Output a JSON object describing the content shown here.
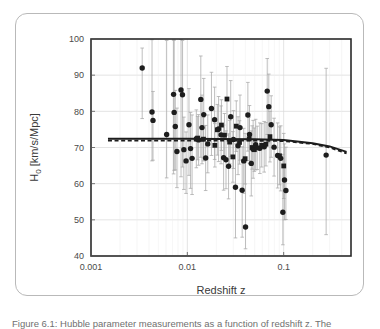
{
  "figure": {
    "caption": "Figure 6.1: Hubble parameter measurements as a function of redshift z. The"
  },
  "chart_data": {
    "type": "scatter",
    "title": "",
    "xlabel": "Redshift z",
    "ylabel": "H₀ [km/s/Mpc]",
    "xscale": "log",
    "yscale": "linear",
    "xlim": [
      0.001,
      0.5
    ],
    "ylim": [
      40,
      100
    ],
    "xticks": [
      0.001,
      0.01,
      0.1
    ],
    "xticklabels": [
      "0.001",
      "0.01",
      "0.1"
    ],
    "yticks": [
      40,
      50,
      60,
      70,
      80,
      90,
      100
    ],
    "yticklabels": [
      "40",
      "50",
      "60",
      "70",
      "80",
      "90",
      "100"
    ],
    "grid": true,
    "legend": "none",
    "series": [
      {
        "name": "H0 measurements (circles)",
        "marker": "circle",
        "color": "#1d1d1d",
        "points": [
          {
            "x": 0.0034,
            "y": 92.0,
            "yerr_lo": 14.0,
            "yerr_hi": 5.5
          },
          {
            "x": 0.0043,
            "y": 79.8,
            "yerr_lo": 13.5,
            "yerr_hi": 20.0
          },
          {
            "x": 0.0044,
            "y": 77.5,
            "yerr_lo": 11.0,
            "yerr_hi": 8.0
          },
          {
            "x": 0.0061,
            "y": 73.6,
            "yerr_lo": 12.0,
            "yerr_hi": 26.0
          },
          {
            "x": 0.0072,
            "y": 84.7,
            "yerr_lo": 22.0,
            "yerr_hi": 15.0
          },
          {
            "x": 0.0073,
            "y": 79.7,
            "yerr_lo": 16.0,
            "yerr_hi": 20.0
          },
          {
            "x": 0.0075,
            "y": 75.8,
            "yerr_lo": 12.0,
            "yerr_hi": 10.0
          },
          {
            "x": 0.0078,
            "y": 68.9,
            "yerr_lo": 10.0,
            "yerr_hi": 12.0
          },
          {
            "x": 0.0086,
            "y": 85.9,
            "yerr_lo": 24.0,
            "yerr_hi": 14.0
          },
          {
            "x": 0.0089,
            "y": 84.6,
            "yerr_lo": 20.0,
            "yerr_hi": 15.0
          },
          {
            "x": 0.0092,
            "y": 69.4,
            "yerr_lo": 11.0,
            "yerr_hi": 9.0
          },
          {
            "x": 0.0097,
            "y": 66.3,
            "yerr_lo": 9.0,
            "yerr_hi": 8.0
          },
          {
            "x": 0.0104,
            "y": 76.3,
            "yerr_lo": 14.0,
            "yerr_hi": 10.0
          },
          {
            "x": 0.0108,
            "y": 69.7,
            "yerr_lo": 11.0,
            "yerr_hi": 10.0
          },
          {
            "x": 0.0112,
            "y": 67.0,
            "yerr_lo": 10.0,
            "yerr_hi": 12.0
          },
          {
            "x": 0.0124,
            "y": 72.4,
            "yerr_lo": 8.0,
            "yerr_hi": 8.0
          },
          {
            "x": 0.0131,
            "y": 72.1,
            "yerr_lo": 7.0,
            "yerr_hi": 7.0
          },
          {
            "x": 0.0138,
            "y": 83.3,
            "yerr_lo": 16.0,
            "yerr_hi": 12.0
          },
          {
            "x": 0.0142,
            "y": 75.5,
            "yerr_lo": 10.0,
            "yerr_hi": 9.0
          },
          {
            "x": 0.0148,
            "y": 79.1,
            "yerr_lo": 12.0,
            "yerr_hi": 10.0
          },
          {
            "x": 0.0155,
            "y": 67.1,
            "yerr_lo": 9.0,
            "yerr_hi": 9.0
          },
          {
            "x": 0.0163,
            "y": 71.0,
            "yerr_lo": 8.0,
            "yerr_hi": 8.0
          },
          {
            "x": 0.0178,
            "y": 80.8,
            "yerr_lo": 13.0,
            "yerr_hi": 10.0
          },
          {
            "x": 0.0192,
            "y": 77.7,
            "yerr_lo": 11.0,
            "yerr_hi": 9.0
          },
          {
            "x": 0.0211,
            "y": 75.1,
            "yerr_lo": 9.0,
            "yerr_hi": 9.0
          },
          {
            "x": 0.0224,
            "y": 73.5,
            "yerr_lo": 8.0,
            "yerr_hi": 8.0
          },
          {
            "x": 0.0238,
            "y": 67.2,
            "yerr_lo": 9.0,
            "yerr_hi": 9.0
          },
          {
            "x": 0.0252,
            "y": 66.6,
            "yerr_lo": 8.0,
            "yerr_hi": 8.0
          },
          {
            "x": 0.0268,
            "y": 64.8,
            "yerr_lo": 9.0,
            "yerr_hi": 9.0
          },
          {
            "x": 0.0282,
            "y": 78.5,
            "yerr_lo": 11.0,
            "yerr_hi": 10.0
          },
          {
            "x": 0.0301,
            "y": 72.2,
            "yerr_lo": 8.0,
            "yerr_hi": 8.0
          },
          {
            "x": 0.0316,
            "y": 59.0,
            "yerr_lo": 14.0,
            "yerr_hi": 12.0
          },
          {
            "x": 0.0336,
            "y": 70.5,
            "yerr_lo": 8.0,
            "yerr_hi": 8.0
          },
          {
            "x": 0.0352,
            "y": 75.5,
            "yerr_lo": 9.0,
            "yerr_hi": 9.0
          },
          {
            "x": 0.0371,
            "y": 58.2,
            "yerr_lo": 13.0,
            "yerr_hi": 12.0
          },
          {
            "x": 0.0385,
            "y": 66.3,
            "yerr_lo": 9.0,
            "yerr_hi": 9.0
          },
          {
            "x": 0.0402,
            "y": 48.0,
            "yerr_lo": 6.0,
            "yerr_hi": 18.0
          },
          {
            "x": 0.0425,
            "y": 79.0,
            "yerr_lo": 10.0,
            "yerr_hi": 9.0
          },
          {
            "x": 0.0442,
            "y": 73.6,
            "yerr_lo": 8.0,
            "yerr_hi": 8.0
          },
          {
            "x": 0.0461,
            "y": 65.6,
            "yerr_lo": 9.0,
            "yerr_hi": 9.0
          },
          {
            "x": 0.0482,
            "y": 69.5,
            "yerr_lo": 8.0,
            "yerr_hi": 8.0
          },
          {
            "x": 0.0512,
            "y": 70.8,
            "yerr_lo": 7.0,
            "yerr_hi": 7.0
          },
          {
            "x": 0.0566,
            "y": 69.8,
            "yerr_lo": 7.0,
            "yerr_hi": 7.0
          },
          {
            "x": 0.0628,
            "y": 70.2,
            "yerr_lo": 7.0,
            "yerr_hi": 7.0
          },
          {
            "x": 0.0675,
            "y": 85.6,
            "yerr_lo": 12.0,
            "yerr_hi": 9.0
          },
          {
            "x": 0.0701,
            "y": 81.3,
            "yerr_lo": 10.0,
            "yerr_hi": 9.0
          },
          {
            "x": 0.0742,
            "y": 76.3,
            "yerr_lo": 9.0,
            "yerr_hi": 8.0
          },
          {
            "x": 0.0795,
            "y": 70.1,
            "yerr_lo": 8.0,
            "yerr_hi": 8.0
          },
          {
            "x": 0.0866,
            "y": 67.8,
            "yerr_lo": 9.0,
            "yerr_hi": 9.0
          },
          {
            "x": 0.0932,
            "y": 67.0,
            "yerr_lo": 9.0,
            "yerr_hi": 9.0
          },
          {
            "x": 0.102,
            "y": 61.0,
            "yerr_lo": 11.0,
            "yerr_hi": 10.0
          },
          {
            "x": 0.0981,
            "y": 52.1,
            "yerr_lo": 9.0,
            "yerr_hi": 16.0
          },
          {
            "x": 0.1055,
            "y": 58.1,
            "yerr_lo": 8.0,
            "yerr_hi": 12.0
          },
          {
            "x": 0.276,
            "y": 67.9,
            "yerr_lo": 22.0,
            "yerr_hi": 24.0
          }
        ]
      },
      {
        "name": "H0 measurements (squares)",
        "marker": "square",
        "color": "#1d1d1d",
        "points": [
          {
            "x": 0.0128,
            "y": 72.6,
            "yerr_lo": 6.0,
            "yerr_hi": 6.0
          },
          {
            "x": 0.0147,
            "y": 72.3,
            "yerr_lo": 6.0,
            "yerr_hi": 6.0
          },
          {
            "x": 0.0205,
            "y": 74.9,
            "yerr_lo": 7.0,
            "yerr_hi": 7.0
          },
          {
            "x": 0.0226,
            "y": 76.2,
            "yerr_lo": 7.0,
            "yerr_hi": 7.0
          },
          {
            "x": 0.0258,
            "y": 83.4,
            "yerr_lo": 10.0,
            "yerr_hi": 9.0
          },
          {
            "x": 0.0275,
            "y": 71.5,
            "yerr_lo": 6.0,
            "yerr_hi": 6.0
          },
          {
            "x": 0.0297,
            "y": 67.4,
            "yerr_lo": 7.0,
            "yerr_hi": 7.0
          },
          {
            "x": 0.0322,
            "y": 75.9,
            "yerr_lo": 7.0,
            "yerr_hi": 7.0
          },
          {
            "x": 0.0348,
            "y": 71.4,
            "yerr_lo": 6.0,
            "yerr_hi": 6.0
          },
          {
            "x": 0.0398,
            "y": 66.9,
            "yerr_lo": 7.0,
            "yerr_hi": 7.0
          },
          {
            "x": 0.0438,
            "y": 72.4,
            "yerr_lo": 6.0,
            "yerr_hi": 6.0
          },
          {
            "x": 0.0471,
            "y": 70.0,
            "yerr_lo": 6.0,
            "yerr_hi": 6.0
          },
          {
            "x": 0.0496,
            "y": 69.4,
            "yerr_lo": 6.0,
            "yerr_hi": 6.0
          },
          {
            "x": 0.0531,
            "y": 69.9,
            "yerr_lo": 6.0,
            "yerr_hi": 6.0
          },
          {
            "x": 0.0592,
            "y": 70.6,
            "yerr_lo": 6.0,
            "yerr_hi": 6.0
          },
          {
            "x": 0.0655,
            "y": 70.9,
            "yerr_lo": 6.0,
            "yerr_hi": 6.0
          },
          {
            "x": 0.072,
            "y": 73.0,
            "yerr_lo": 7.0,
            "yerr_hi": 7.0
          },
          {
            "x": 0.0905,
            "y": 67.7,
            "yerr_lo": 8.0,
            "yerr_hi": 8.0
          },
          {
            "x": 0.1002,
            "y": 64.9,
            "yerr_lo": 9.0,
            "yerr_hi": 9.0
          },
          {
            "x": 0.0193,
            "y": 70.6,
            "yerr_lo": 6.0,
            "yerr_hi": 6.0
          },
          {
            "x": 0.0243,
            "y": 73.4,
            "yerr_lo": 6.0,
            "yerr_hi": 6.0
          }
        ]
      }
    ],
    "model_curves": [
      {
        "name": "model-solid",
        "style": "solid",
        "color": "#1d1d1d",
        "points": [
          {
            "x": 0.0015,
            "y": 72.4
          },
          {
            "x": 0.01,
            "y": 72.4
          },
          {
            "x": 0.05,
            "y": 72.3
          },
          {
            "x": 0.1,
            "y": 72.1
          },
          {
            "x": 0.2,
            "y": 71.2
          },
          {
            "x": 0.3,
            "y": 70.3
          },
          {
            "x": 0.45,
            "y": 68.8
          }
        ]
      },
      {
        "name": "model-dashed",
        "style": "dashed",
        "color": "#1d1d1d",
        "points": [
          {
            "x": 0.0015,
            "y": 71.9
          },
          {
            "x": 0.01,
            "y": 71.9
          },
          {
            "x": 0.05,
            "y": 71.9
          },
          {
            "x": 0.1,
            "y": 71.8
          },
          {
            "x": 0.2,
            "y": 71.0
          },
          {
            "x": 0.3,
            "y": 70.0
          },
          {
            "x": 0.45,
            "y": 68.4
          }
        ]
      }
    ]
  }
}
